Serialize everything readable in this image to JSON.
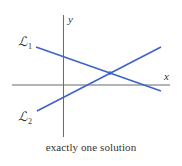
{
  "diagram": {
    "caption": "exactly one solution",
    "axes": {
      "x_label": "x",
      "y_label": "y",
      "color": "#666666"
    },
    "lines": [
      {
        "name": "L1",
        "label_main": "ℒ",
        "label_sub": "1",
        "color": "#3d62c9"
      },
      {
        "name": "L2",
        "label_main": "ℒ",
        "label_sub": "2",
        "color": "#3d62c9"
      }
    ],
    "intersection": {
      "count": 1,
      "color": "#3d62c9"
    }
  }
}
